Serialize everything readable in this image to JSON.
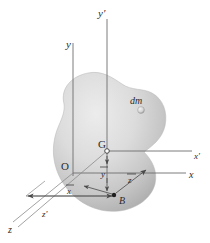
{
  "figure": {
    "background_color": "#ffffff",
    "body_fill_light": "#e4e4e4",
    "body_fill_mid": "#c9c9c9",
    "body_fill_dark": "#a8a8a8",
    "axis_color": "#6e6e6e",
    "label_color": "#2b2b2b"
  },
  "axes": {
    "y_label": "y",
    "y_prime_label": "y'",
    "x_label": "x",
    "x_prime_label": "x'",
    "z_label": "z",
    "z_prime_label": "z'"
  },
  "points": {
    "origin_label": "O",
    "centroid_label": "G",
    "point_b_label": "B",
    "mass_element_label": "dm"
  },
  "dimensions": {
    "x_bar_label": "x",
    "x_bar_overbar": true,
    "y_bar_label": "y",
    "y_bar_overbar": true,
    "z_bar_label": "z",
    "z_bar_overbar": true
  }
}
